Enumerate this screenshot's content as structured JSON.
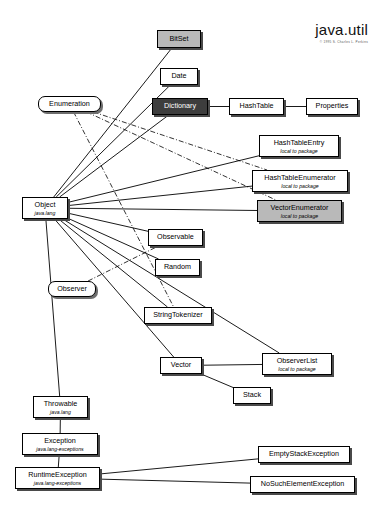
{
  "diagram": {
    "title": "java.util",
    "subtitle": "© 1995 S. Charles L. Perkins",
    "legend": {
      "local_to_package": "local to package"
    }
  },
  "nodes": [
    {
      "id": "bitset",
      "label": "BitSet",
      "sub": "",
      "style": "shaded",
      "x": 157,
      "y": 30,
      "w": 44,
      "h": 18
    },
    {
      "id": "date",
      "label": "Date",
      "sub": "",
      "style": "plain",
      "x": 160,
      "y": 68,
      "w": 38,
      "h": 17
    },
    {
      "id": "enumeration",
      "label": "Enumeration",
      "sub": "",
      "style": "rounded",
      "x": 38,
      "y": 96,
      "w": 63,
      "h": 16
    },
    {
      "id": "dictionary",
      "label": "Dictionary",
      "sub": "",
      "style": "dark",
      "x": 152,
      "y": 98,
      "w": 56,
      "h": 17
    },
    {
      "id": "hashtable",
      "label": "HashTable",
      "sub": "",
      "style": "plain",
      "x": 229,
      "y": 98,
      "w": 55,
      "h": 17
    },
    {
      "id": "properties",
      "label": "Properties",
      "sub": "",
      "style": "plain",
      "x": 306,
      "y": 98,
      "w": 52,
      "h": 17
    },
    {
      "id": "htentry",
      "label": "HashTableEntry",
      "sub": "local to package",
      "style": "plain",
      "x": 259,
      "y": 135,
      "w": 80,
      "h": 22
    },
    {
      "id": "htenum",
      "label": "HashTableEnumerator",
      "sub": "local to package",
      "style": "plain",
      "x": 252,
      "y": 170,
      "w": 96,
      "h": 22
    },
    {
      "id": "vecenum",
      "label": "VectorEnumerator",
      "sub": "local to package",
      "style": "shaded",
      "x": 257,
      "y": 200,
      "w": 85,
      "h": 22
    },
    {
      "id": "object",
      "label": "Object",
      "sub": "java.lang",
      "style": "plain",
      "x": 22,
      "y": 197,
      "w": 46,
      "h": 22
    },
    {
      "id": "observable",
      "label": "Observable",
      "sub": "",
      "style": "plain",
      "x": 148,
      "y": 229,
      "w": 55,
      "h": 17
    },
    {
      "id": "random",
      "label": "Random",
      "sub": "",
      "style": "plain",
      "x": 155,
      "y": 259,
      "w": 45,
      "h": 17
    },
    {
      "id": "observer",
      "label": "Observer",
      "sub": "",
      "style": "rounded",
      "x": 48,
      "y": 281,
      "w": 48,
      "h": 16
    },
    {
      "id": "strtok",
      "label": "StringTokenizer",
      "sub": "",
      "style": "plain",
      "x": 144,
      "y": 307,
      "w": 68,
      "h": 17
    },
    {
      "id": "vector",
      "label": "Vector",
      "sub": "",
      "style": "plain",
      "x": 160,
      "y": 357,
      "w": 42,
      "h": 17
    },
    {
      "id": "observerlist",
      "label": "ObserverList",
      "sub": "local to package",
      "style": "plain",
      "x": 262,
      "y": 353,
      "w": 70,
      "h": 22
    },
    {
      "id": "stack",
      "label": "Stack",
      "sub": "",
      "style": "plain",
      "x": 233,
      "y": 387,
      "w": 38,
      "h": 17
    },
    {
      "id": "throwable",
      "label": "Throwable",
      "sub": "java.lang",
      "style": "plain",
      "x": 33,
      "y": 396,
      "w": 55,
      "h": 22
    },
    {
      "id": "exception",
      "label": "Exception",
      "sub": "java.lang-exceptions",
      "style": "plain",
      "x": 22,
      "y": 433,
      "w": 76,
      "h": 22
    },
    {
      "id": "runtimeexc",
      "label": "RuntimeException",
      "sub": "java.lang-exceptions",
      "style": "plain",
      "x": 15,
      "y": 467,
      "w": 85,
      "h": 22
    },
    {
      "id": "emptystack",
      "label": "EmptyStackException",
      "sub": "",
      "style": "plain",
      "x": 258,
      "y": 446,
      "w": 92,
      "h": 17
    },
    {
      "id": "nosuchelem",
      "label": "NoSuchElementException",
      "sub": "",
      "style": "plain",
      "x": 250,
      "y": 476,
      "w": 105,
      "h": 17
    }
  ],
  "edges": [
    {
      "from": "object",
      "to": "bitset",
      "kind": "inherits"
    },
    {
      "from": "object",
      "to": "date",
      "kind": "inherits"
    },
    {
      "from": "object",
      "to": "dictionary",
      "kind": "inherits"
    },
    {
      "from": "object",
      "to": "htentry",
      "kind": "inherits"
    },
    {
      "from": "object",
      "to": "htenum",
      "kind": "inherits"
    },
    {
      "from": "object",
      "to": "vecenum",
      "kind": "inherits"
    },
    {
      "from": "object",
      "to": "observable",
      "kind": "inherits"
    },
    {
      "from": "object",
      "to": "random",
      "kind": "inherits"
    },
    {
      "from": "object",
      "to": "strtok",
      "kind": "inherits"
    },
    {
      "from": "object",
      "to": "vector",
      "kind": "inherits"
    },
    {
      "from": "object",
      "to": "observerlist",
      "kind": "inherits"
    },
    {
      "from": "object",
      "to": "throwable",
      "kind": "inherits"
    },
    {
      "from": "dictionary",
      "to": "hashtable",
      "kind": "inherits"
    },
    {
      "from": "hashtable",
      "to": "properties",
      "kind": "inherits"
    },
    {
      "from": "vector",
      "to": "stack",
      "kind": "inherits"
    },
    {
      "from": "vector",
      "to": "observerlist",
      "kind": "inherits"
    },
    {
      "from": "throwable",
      "to": "exception",
      "kind": "inherits"
    },
    {
      "from": "exception",
      "to": "runtimeexc",
      "kind": "inherits"
    },
    {
      "from": "runtimeexc",
      "to": "emptystack",
      "kind": "inherits"
    },
    {
      "from": "runtimeexc",
      "to": "nosuchelem",
      "kind": "inherits"
    },
    {
      "from": "enumeration",
      "to": "htenum",
      "kind": "implements"
    },
    {
      "from": "enumeration",
      "to": "vecenum",
      "kind": "implements"
    },
    {
      "from": "enumeration",
      "to": "strtok",
      "kind": "implements"
    },
    {
      "from": "observer",
      "to": "observable",
      "kind": "implements"
    }
  ]
}
